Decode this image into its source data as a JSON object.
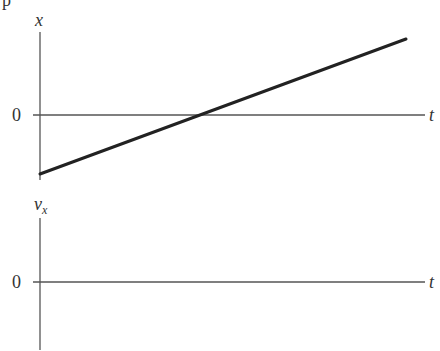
{
  "top_glyph": "p",
  "colors": {
    "axis": "#555555",
    "line": "#222222",
    "text": "#333333"
  },
  "panels": [
    {
      "id": "position-graph",
      "y_label": "x",
      "x_label": "t",
      "zero_label": "0",
      "description": "Position increases linearly with time, starting negative and crossing zero",
      "line": {
        "start": {
          "t": 0,
          "x": -1
        },
        "end": {
          "t": 2.2,
          "x": 1.2
        }
      }
    },
    {
      "id": "velocity-graph",
      "y_label": "v",
      "y_label_sub": "x",
      "x_label": "t",
      "zero_label": "0",
      "description": "Empty velocity axes to be filled in"
    }
  ]
}
